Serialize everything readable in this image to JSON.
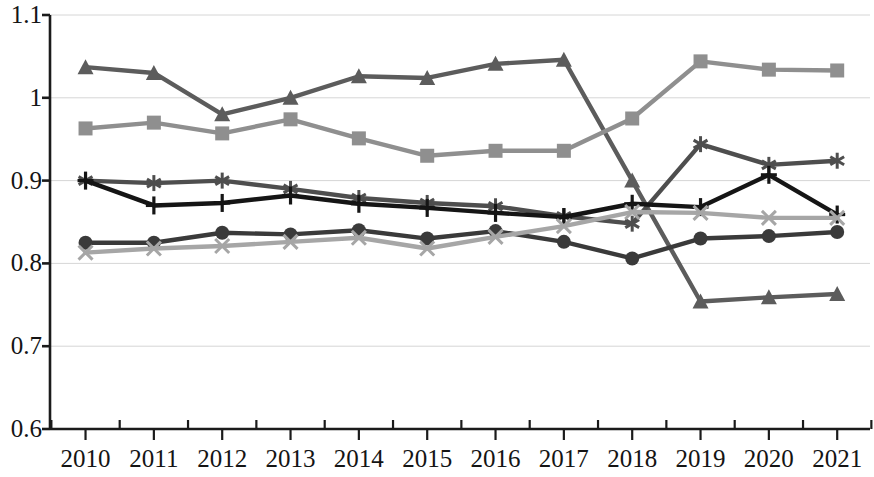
{
  "chart_data": {
    "type": "line",
    "title": "",
    "subtitle": "",
    "xlabel": "",
    "ylabel": "",
    "grid": true,
    "legend_position": "none",
    "categories": [
      "2010",
      "2011",
      "2012",
      "2013",
      "2014",
      "2015",
      "2016",
      "2017",
      "2018",
      "2019",
      "2020",
      "2021"
    ],
    "x": [
      2010,
      2011,
      2012,
      2013,
      2014,
      2015,
      2016,
      2017,
      2018,
      2019,
      2020,
      2021
    ],
    "ylim": [
      0.6,
      1.1
    ],
    "ytick_labels": [
      "1.1",
      "1",
      "0.9",
      "0.8",
      "0.7",
      "0.6"
    ],
    "ytick_values": [
      1.1,
      1.0,
      0.9,
      0.8,
      0.7,
      0.6
    ],
    "series": [
      {
        "name": "series-triangle",
        "marker": "triangle",
        "color": "#5c5c5c",
        "values": [
          1.037,
          1.03,
          0.98,
          1.0,
          1.026,
          1.024,
          1.041,
          1.046,
          0.9,
          0.754,
          0.759,
          0.763
        ]
      },
      {
        "name": "series-square",
        "marker": "square",
        "color": "#8f8f8f",
        "values": [
          0.963,
          0.97,
          0.957,
          0.974,
          0.951,
          0.93,
          0.936,
          0.936,
          0.975,
          1.044,
          1.034,
          1.033
        ]
      },
      {
        "name": "series-asterisk",
        "marker": "asterisk",
        "color": "#4e4e4e",
        "values": [
          0.9,
          0.897,
          0.9,
          0.89,
          0.879,
          0.873,
          0.869,
          0.857,
          0.848,
          0.944,
          0.919,
          0.924
        ]
      },
      {
        "name": "series-plus",
        "marker": "plus",
        "color": "#151515",
        "values": [
          0.9,
          0.87,
          0.873,
          0.882,
          0.872,
          0.867,
          0.861,
          0.856,
          0.872,
          0.868,
          0.907,
          0.859
        ]
      },
      {
        "name": "series-circle",
        "marker": "circle",
        "color": "#3a3a3a",
        "values": [
          0.825,
          0.825,
          0.837,
          0.835,
          0.84,
          0.83,
          0.839,
          0.826,
          0.806,
          0.83,
          0.833,
          0.838
        ]
      },
      {
        "name": "series-x",
        "marker": "x",
        "color": "#a6a6a6",
        "values": [
          0.813,
          0.818,
          0.821,
          0.826,
          0.831,
          0.818,
          0.832,
          0.845,
          0.862,
          0.861,
          0.855,
          0.855
        ]
      }
    ],
    "axis": {
      "color": "#1b1b1b",
      "gridline_color": "#d6d6d6"
    }
  }
}
